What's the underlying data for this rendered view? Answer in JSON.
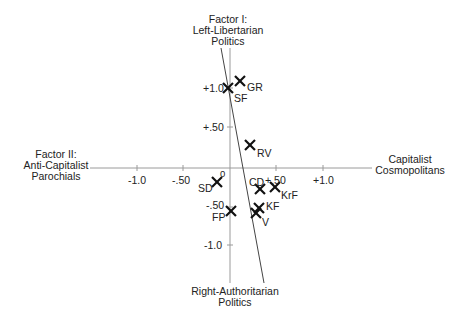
{
  "diagram": {
    "axes": {
      "vertical": {
        "top_label": [
          "Factor I:",
          "Left-Libertarian",
          "Politics"
        ],
        "bottom_label": [
          "Right-Authoritarian",
          "Politics"
        ],
        "ticks": [
          "+1.0",
          "+.50",
          "-.50",
          "-1.0"
        ]
      },
      "horizontal": {
        "left_label": [
          "Factor II:",
          "Anti-Capitalist",
          "Parochials"
        ],
        "right_label": [
          "Capitalist",
          "Cosmopolitans"
        ],
        "ticks": [
          "-1.0",
          "-.50",
          "0",
          "+.50",
          "+1.0"
        ]
      }
    },
    "points": [
      {
        "label": "GR",
        "x": 0.11,
        "y": 1.09
      },
      {
        "label": "SF",
        "x": -0.02,
        "y": 1.0
      },
      {
        "label": "RV",
        "x": 0.22,
        "y": 0.29
      },
      {
        "label": "SD",
        "x": -0.14,
        "y": -0.17
      },
      {
        "label": "CD",
        "x": 0.32,
        "y": -0.26
      },
      {
        "label": "KrF",
        "x": 0.48,
        "y": -0.24
      },
      {
        "label": "KF",
        "x": 0.31,
        "y": -0.5
      },
      {
        "label": "V",
        "x": 0.28,
        "y": -0.56
      },
      {
        "label": "FP",
        "x": 0.01,
        "y": -0.54
      }
    ],
    "colors": {
      "axis": "#999999",
      "diagonal": "#333333",
      "marker": "#111111"
    }
  }
}
